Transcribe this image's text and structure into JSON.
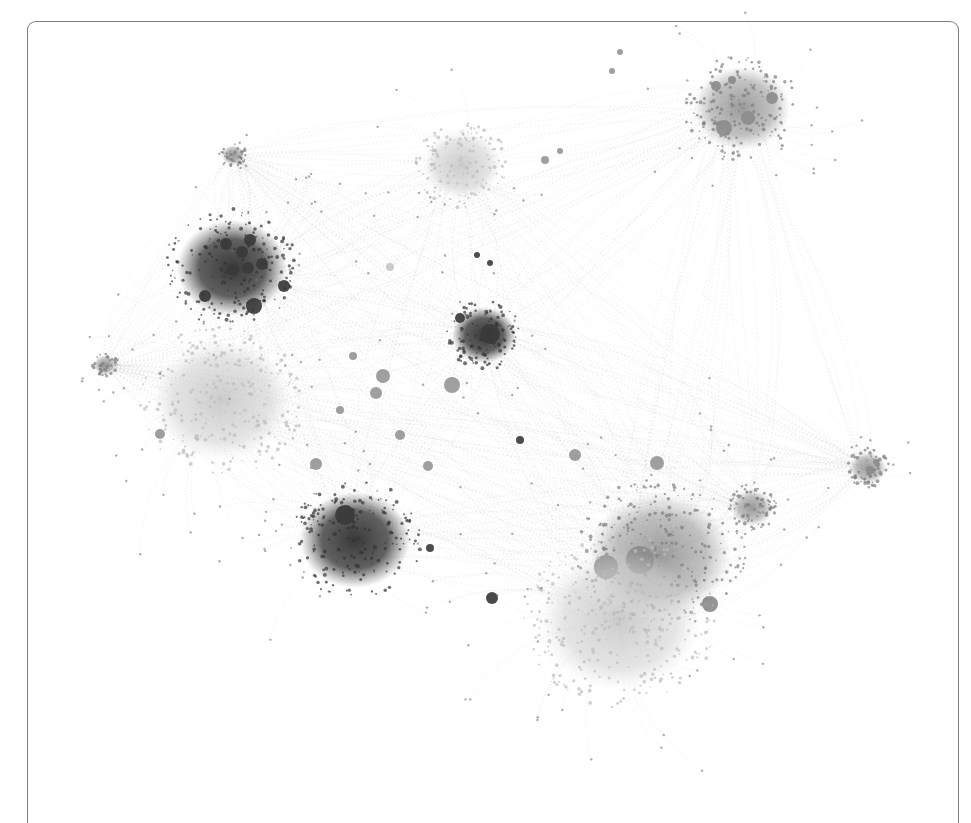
{
  "figure": {
    "type": "network-graph",
    "frame": {
      "border_color": "#7d7d7d",
      "background": "#ffffff"
    },
    "colors": {
      "dark": "#3a3a3a",
      "medium": "#8a8a8a",
      "light": "#c8c8c8",
      "edge": "#9a9a9a"
    },
    "clusters": [
      {
        "id": "upper-left-dark",
        "cx": 232,
        "cy": 268,
        "r": 48,
        "shade": "dark",
        "hubs": [
          [
            226,
            244,
            6
          ],
          [
            242,
            252,
            6
          ],
          [
            250,
            240,
            6
          ],
          [
            262,
            264,
            6
          ],
          [
            248,
            268,
            6
          ],
          [
            233,
            270,
            6
          ],
          [
            284,
            286,
            6
          ],
          [
            254,
            306,
            8
          ],
          [
            205,
            296,
            6
          ]
        ]
      },
      {
        "id": "center-dark",
        "cx": 484,
        "cy": 335,
        "r": 28,
        "shade": "dark",
        "hubs": [
          [
            460,
            318,
            5
          ],
          [
            490,
            334,
            10
          ]
        ]
      },
      {
        "id": "lower-left-dark",
        "cx": 355,
        "cy": 540,
        "r": 48,
        "shade": "dark",
        "hubs": [
          [
            345,
            515,
            10
          ],
          [
            492,
            598,
            6
          ]
        ]
      },
      {
        "id": "top-center-light",
        "cx": 462,
        "cy": 165,
        "r": 34,
        "shade": "light",
        "hubs": []
      },
      {
        "id": "top-right-medium",
        "cx": 742,
        "cy": 108,
        "r": 42,
        "shade": "medium",
        "hubs": [
          [
            724,
            128,
            8
          ],
          [
            748,
            118,
            7
          ],
          [
            772,
            98,
            6
          ],
          [
            716,
            86,
            5
          ],
          [
            732,
            80,
            4
          ]
        ]
      },
      {
        "id": "left-light",
        "cx": 222,
        "cy": 400,
        "r": 60,
        "shade": "light",
        "hubs": []
      },
      {
        "id": "lower-right-medium",
        "cx": 660,
        "cy": 555,
        "r": 62,
        "shade": "medium",
        "hubs": [
          [
            606,
            567,
            12
          ],
          [
            640,
            560,
            14
          ],
          [
            710,
            604,
            8
          ]
        ]
      },
      {
        "id": "lower-right-light",
        "cx": 620,
        "cy": 620,
        "r": 70,
        "shade": "light",
        "hubs": []
      },
      {
        "id": "right-arm-medium",
        "cx": 752,
        "cy": 508,
        "r": 18,
        "shade": "medium",
        "hubs": []
      },
      {
        "id": "far-right-small",
        "cx": 868,
        "cy": 468,
        "r": 16,
        "shade": "medium",
        "hubs": [
          [
            870,
            470,
            4
          ],
          [
            876,
            462,
            3
          ]
        ]
      },
      {
        "id": "top-left-small",
        "cx": 233,
        "cy": 155,
        "r": 10,
        "shade": "medium",
        "hubs": []
      },
      {
        "id": "left-small",
        "cx": 105,
        "cy": 365,
        "r": 10,
        "shade": "medium",
        "hubs": []
      }
    ],
    "scattered_nodes": [
      [
        383,
        376,
        7,
        "medium"
      ],
      [
        376,
        393,
        6,
        "medium"
      ],
      [
        452,
        385,
        8,
        "medium"
      ],
      [
        400,
        435,
        5,
        "medium"
      ],
      [
        575,
        455,
        6,
        "medium"
      ],
      [
        657,
        463,
        7,
        "medium"
      ],
      [
        316,
        464,
        6,
        "medium"
      ],
      [
        160,
        434,
        5,
        "medium"
      ],
      [
        340,
        410,
        4,
        "medium"
      ],
      [
        520,
        440,
        4,
        "dark"
      ],
      [
        477,
        255,
        3,
        "dark"
      ],
      [
        490,
        263,
        3,
        "dark"
      ],
      [
        353,
        356,
        4,
        "medium"
      ],
      [
        428,
        466,
        5,
        "medium"
      ],
      [
        390,
        267,
        4,
        "light"
      ],
      [
        545,
        160,
        4,
        "medium"
      ],
      [
        560,
        151,
        3,
        "medium"
      ],
      [
        620,
        52,
        3,
        "medium"
      ],
      [
        612,
        71,
        3,
        "medium"
      ],
      [
        430,
        548,
        4,
        "dark"
      ]
    ]
  }
}
